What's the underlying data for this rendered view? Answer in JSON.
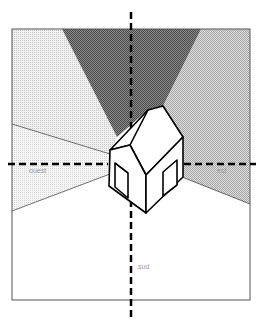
{
  "diagram": {
    "labels": {
      "west": "ouest",
      "east": "est",
      "south": "sud"
    },
    "colors": {
      "north_wedge": "#6e6e6e",
      "side_light": "#d8d8d8",
      "east_medium": "#bdbdbd",
      "west_light": "#e6e6e6",
      "south": "#ffffff",
      "outline": "#000000"
    }
  }
}
